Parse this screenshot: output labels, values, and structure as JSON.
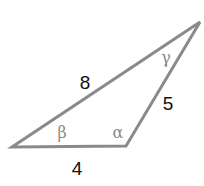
{
  "diagram": {
    "type": "triangle",
    "stroke_color": "#8a8a8a",
    "text_color": "#111111",
    "vertices": {
      "left": [
        12,
        147
      ],
      "bottom_right": [
        126,
        146
      ],
      "top": [
        200,
        22
      ]
    },
    "sides": [
      {
        "id": "bottom",
        "label": "4",
        "pos": [
          77,
          175
        ]
      },
      {
        "id": "right",
        "label": "5",
        "pos": [
          168,
          110
        ]
      },
      {
        "id": "hypotenuse",
        "label": "8",
        "pos": [
          85,
          89
        ]
      }
    ],
    "angles": [
      {
        "id": "beta",
        "label": "β",
        "pos": [
          62,
          138
        ]
      },
      {
        "id": "alpha",
        "label": "α",
        "pos": [
          118,
          138
        ]
      },
      {
        "id": "gamma",
        "label": "γ",
        "pos": [
          166,
          63
        ]
      }
    ]
  }
}
